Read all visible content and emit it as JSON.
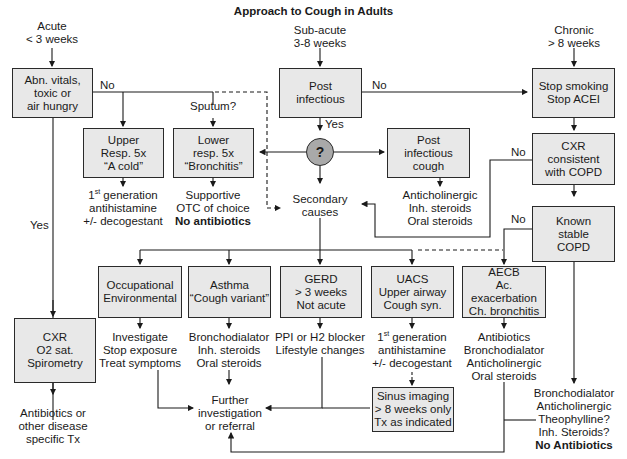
{
  "title": "Approach to Cough in Adults",
  "headers": {
    "acute": [
      "Acute",
      "< 3 weeks"
    ],
    "subacute": [
      "Sub-acute",
      "3-8 weeks"
    ],
    "chronic": [
      "Chronic",
      "> 8 weeks"
    ]
  },
  "boxes": {
    "abn_vitals": [
      "Abn. vitals,",
      "toxic or",
      "air hungry"
    ],
    "post_infectious": [
      "Post",
      "infectious"
    ],
    "stop_smoking": [
      "Stop smoking",
      "Stop ACEI"
    ],
    "upper_resp": [
      "Upper",
      "Resp. 5x",
      "“A cold”"
    ],
    "lower_resp": [
      "Lower",
      "resp. 5x",
      "“Bronchitis”"
    ],
    "post_infectious_cough": [
      "Post",
      "infectious",
      "cough"
    ],
    "cxr_copd": [
      "CXR",
      "consistent",
      "with COPD"
    ],
    "known_copd": [
      "Known",
      "stable",
      "COPD"
    ],
    "occupational": [
      "Occupational",
      "Environmental"
    ],
    "asthma": [
      "Asthma",
      "“Cough variant”"
    ],
    "gerd": [
      "GERD",
      "> 3 weeks",
      "Not acute"
    ],
    "uacs": [
      "UACS",
      "Upper airway",
      "Cough syn."
    ],
    "aecb": [
      "AECB",
      "Ac. exacerbation",
      "Ch. bronchitis"
    ],
    "cxr_o2": [
      "CXR",
      "O2 sat.",
      "Spirometry"
    ],
    "sinus": [
      "Sinus imaging",
      "> 8 weeks only",
      "Tx as indicated"
    ]
  },
  "decision_node": "?",
  "labels": {
    "no1": "No",
    "no2": "No",
    "no3": "No",
    "no4": "No",
    "yes1": "Yes",
    "yes2": "Yes",
    "sputum": "Sputum?"
  },
  "outcomes": {
    "upper_tx": [
      "1st generation",
      "antihistamine",
      "+/- decogestant"
    ],
    "lower_tx": [
      "Supportive",
      "OTC of choice",
      "No antibiotics"
    ],
    "secondary": [
      "Secondary",
      "causes"
    ],
    "post_tx": [
      "Anticholinergic",
      "Inh. steroids",
      "Oral steroids"
    ],
    "occ_tx": [
      "Investigate",
      "Stop exposure",
      "Treat symptoms"
    ],
    "asthma_tx": [
      "Bronchodialator",
      "Inh. steroids",
      "Oral steroids"
    ],
    "gerd_tx": [
      "PPI or H2 blocker",
      "Lifestyle changes"
    ],
    "uacs_tx": [
      "1st generation",
      "antihistamine",
      "+/- decogestant"
    ],
    "aecb_tx": [
      "Antibiotics",
      "Bronchodialator",
      "Anticholinergic",
      "Oral steroids"
    ],
    "further": [
      "Further",
      "investigation",
      "or referral"
    ],
    "acute_tx": [
      "Antibiotics or",
      "other disease",
      "specific Tx"
    ],
    "copd_tx": [
      "Bronchodialator",
      "Anticholinergic",
      "Theophylline?",
      "Inh. Steroids?",
      "No Antibiotics"
    ]
  }
}
